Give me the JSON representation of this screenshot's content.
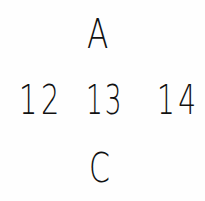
{
  "figure": {
    "top": "A",
    "middle_row": [
      "12",
      "13",
      "14"
    ],
    "bottom": "C",
    "ink_color": "#111111",
    "background_color": "#fefefe"
  }
}
